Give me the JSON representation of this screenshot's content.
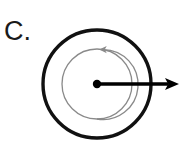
{
  "figure": {
    "panel_label": "C.",
    "caption_text": "",
    "background_color": "#ffffff",
    "width": 188,
    "height": 144
  },
  "colors": {
    "outline": "#111111",
    "rotation_arc": "#8a8a8a",
    "radial_arrow": "#000000",
    "center_dot": "#000000",
    "label_text": "#1a1a1a",
    "background": "#ffffff"
  },
  "elements": {
    "outer_circle": {
      "name": "outer-circle",
      "center_x": 97,
      "center_y": 84,
      "radius": 54,
      "stroke_width": 3.4,
      "stroke_color": "#111111",
      "fill": "none"
    },
    "inner_circle": {
      "name": "inner-rotation-circle",
      "center_x": 97,
      "center_y": 84,
      "radius": 35,
      "stroke_width": 1.3,
      "stroke_color": "#8a8a8a",
      "fill": "none"
    },
    "rotation_arrow": {
      "name": "clockwise-rotation-arrow",
      "direction": "clockwise",
      "arrowhead_x": 129,
      "arrowhead_y": 81,
      "arrowhead_angle_deg": 80,
      "stroke_color": "#8a8a8a",
      "stroke_width": 1.3
    },
    "center_dot": {
      "name": "center-dot",
      "center_x": 97,
      "center_y": 84,
      "radius": 4.2,
      "fill": "#000000"
    },
    "radial_arrow": {
      "name": "radial-arrow",
      "start_x": 97,
      "start_y": 84,
      "tip_x": 179,
      "tip_y": 84,
      "stroke_width": 3.6,
      "stroke_color": "#000000",
      "head_length": 14,
      "head_half_width": 6,
      "points_direction": "right"
    }
  }
}
